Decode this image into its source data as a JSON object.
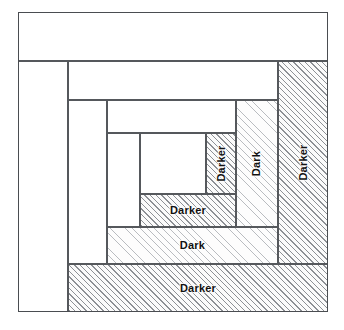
{
  "diagram": {
    "frame": {
      "name": "block-outline"
    },
    "fabric_names": {
      "light": "Light",
      "dark": "Dark",
      "darker": "Darker"
    },
    "colors": {
      "outline": "#4a4d51",
      "patch_outline": "#55585c",
      "light_fill": "#ffffff",
      "dark_hatch": "#b9bcc0",
      "darker_hatch": "#8d9095",
      "label_text": "#111111"
    },
    "patches": [
      {
        "id": "top-light-1",
        "label": "",
        "fabric": "light",
        "orientation": "horizontal",
        "x": 18,
        "y": 12,
        "w": 310,
        "h": 49
      },
      {
        "id": "left-light-1",
        "label": "",
        "fabric": "light",
        "orientation": "vertical",
        "x": 18,
        "y": 61,
        "w": 50,
        "h": 251
      },
      {
        "id": "bottom-darker-outer",
        "label": "Darker",
        "fabric": "darker",
        "orientation": "horizontal",
        "x": 68,
        "y": 264,
        "w": 260,
        "h": 48
      },
      {
        "id": "right-darker-outer",
        "label": "Darker",
        "fabric": "darker",
        "orientation": "vertical",
        "x": 278,
        "y": 61,
        "w": 50,
        "h": 203
      },
      {
        "id": "top-light-2",
        "label": "",
        "fabric": "light",
        "orientation": "horizontal",
        "x": 68,
        "y": 61,
        "w": 210,
        "h": 39
      },
      {
        "id": "left-light-2",
        "label": "",
        "fabric": "light",
        "orientation": "vertical",
        "x": 68,
        "y": 100,
        "w": 39,
        "h": 164
      },
      {
        "id": "bottom-dark-middle",
        "label": "Dark",
        "fabric": "dark",
        "orientation": "horizontal",
        "x": 107,
        "y": 227,
        "w": 171,
        "h": 37
      },
      {
        "id": "right-dark-middle",
        "label": "Dark",
        "fabric": "dark",
        "orientation": "vertical",
        "x": 236,
        "y": 100,
        "w": 42,
        "h": 127
      },
      {
        "id": "top-light-3",
        "label": "",
        "fabric": "light",
        "orientation": "horizontal",
        "x": 107,
        "y": 100,
        "w": 129,
        "h": 33
      },
      {
        "id": "left-light-3",
        "label": "",
        "fabric": "light",
        "orientation": "vertical",
        "x": 107,
        "y": 133,
        "w": 33,
        "h": 94
      },
      {
        "id": "bottom-darker-inner",
        "label": "Darker",
        "fabric": "darker",
        "orientation": "horizontal",
        "x": 140,
        "y": 194,
        "w": 96,
        "h": 33
      },
      {
        "id": "right-darker-inner",
        "label": "Darker",
        "fabric": "darker",
        "orientation": "vertical",
        "x": 206,
        "y": 133,
        "w": 30,
        "h": 61
      },
      {
        "id": "center-light",
        "label": "",
        "fabric": "light",
        "orientation": "horizontal",
        "x": 140,
        "y": 133,
        "w": 66,
        "h": 61
      }
    ]
  }
}
